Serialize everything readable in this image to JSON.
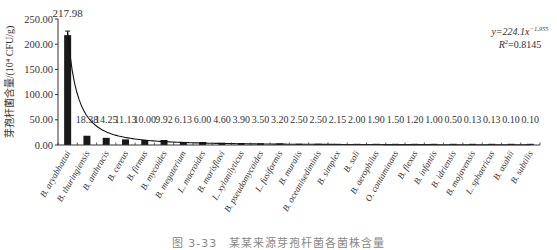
{
  "chart_data": {
    "type": "bar",
    "title": "",
    "xlabel": "",
    "ylabel": "芽孢杆菌含量/(10⁴ CFU/g)",
    "ylim": [
      0,
      250
    ],
    "yticks": [
      "0.00",
      "50.00",
      "100.00",
      "150.00",
      "200.00",
      "250.00"
    ],
    "grid": false,
    "legend": null,
    "categories": [
      "B. aryabhattai",
      "B. thuringiensis",
      "B. anthracis",
      "B. cereus",
      "B. firmus",
      "B. mycoides",
      "B. megaterium",
      "L. macroides",
      "B. marisflavi",
      "L. xylanilyticus",
      "B. pseudomycoides",
      "L. fusiformis",
      "B. muralis",
      "B. oceanisediminis",
      "B. simplex",
      "B. soli",
      "B. aerophilus",
      "O. contaminans",
      "B. flexus",
      "B. infantis",
      "B. idriensis",
      "B. mojavensis",
      "L. sphaericus",
      "B. asahii",
      "B. subtilis"
    ],
    "values": [
      217.98,
      18.38,
      14.25,
      11.13,
      10.0,
      9.92,
      6.13,
      6.0,
      4.6,
      3.9,
      3.5,
      3.2,
      2.5,
      2.5,
      2.15,
      2.0,
      1.9,
      1.5,
      1.2,
      1.0,
      0.5,
      0.13,
      0.13,
      0.1,
      0.1
    ],
    "value_labels": [
      "217.98",
      "18.38",
      "14.25",
      "11.13",
      "10.00",
      "9.92",
      "6.13",
      "6.00",
      "4.60",
      "3.90",
      "3.50",
      "3.20",
      "2.50",
      "2.50",
      "2.15",
      "2.00",
      "1.90",
      "1.50",
      "1.20",
      "1.00",
      "0.50",
      "0.13",
      "0.13",
      "0.10",
      "0.10"
    ],
    "error_bar_first": 8,
    "trendline": {
      "type": "power",
      "equation": "y=224.1x",
      "exponent": "−1.955",
      "r2_label": "R",
      "r2_value": "=0.8145",
      "a": 224.1,
      "b": -1.955
    },
    "bar_color": "#1a1a1a"
  },
  "caption": "图 3-33　某某来源芽孢杆菌各菌株含量"
}
